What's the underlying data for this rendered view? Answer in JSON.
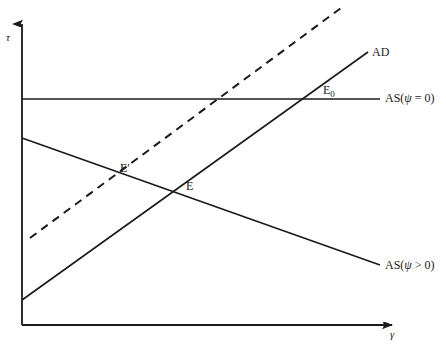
{
  "figure": {
    "background_color": "#ffffff",
    "line_color": "#1a1a1a"
  },
  "axes": {
    "y_axis": {
      "name": "vertical-axis",
      "label": "τ",
      "label_meaning": "tau-inflation-tax-rate",
      "x_px": 22,
      "top_px": 18,
      "bottom_px": 325,
      "arrow": "up"
    },
    "x_axis": {
      "name": "horizontal-axis",
      "label": "γ",
      "label_meaning": "gamma-growth-rate",
      "y_px": 325,
      "left_px": 22,
      "right_px": 400,
      "arrow": "right"
    }
  },
  "curves": [
    {
      "id": "ad",
      "label": "AD",
      "style": "solid",
      "slope": "upward",
      "from": [
        22,
        300
      ],
      "to": [
        368,
        52
      ]
    },
    {
      "id": "ad-shifted",
      "label": "",
      "style": "dashed",
      "slope": "upward",
      "from": [
        30,
        238
      ],
      "to": [
        345,
        5
      ]
    },
    {
      "id": "as-zero",
      "label": "AS(ψ = 0)",
      "label_parts": {
        "prefix": "AS(",
        "symbol": "ψ",
        "relation": " = 0)"
      },
      "style": "solid",
      "slope": "horizontal",
      "from": [
        22,
        99
      ],
      "to": [
        380,
        99
      ]
    },
    {
      "id": "as-positive",
      "label": "AS(ψ > 0)",
      "label_parts": {
        "prefix": "AS(",
        "symbol": "ψ",
        "relation": " > 0)"
      },
      "style": "solid",
      "slope": "downward",
      "from": [
        22,
        138
      ],
      "to": [
        380,
        265
      ]
    }
  ],
  "points": [
    {
      "id": "e0",
      "label_base": "E",
      "label_sub": "0",
      "x_px": 303,
      "y_px": 99,
      "description": "intersection of AD and AS(psi = 0)"
    },
    {
      "id": "e",
      "label_base": "E",
      "label_sub": "",
      "x_px": 187,
      "y_px": 192,
      "description": "intersection of AD and AS(psi > 0)"
    },
    {
      "id": "e-prime",
      "label_base": "E′",
      "label_sub": "",
      "x_px": 113,
      "y_px": 170,
      "description": "intersection of dashed shifted AD and AS(psi > 0)"
    }
  ]
}
